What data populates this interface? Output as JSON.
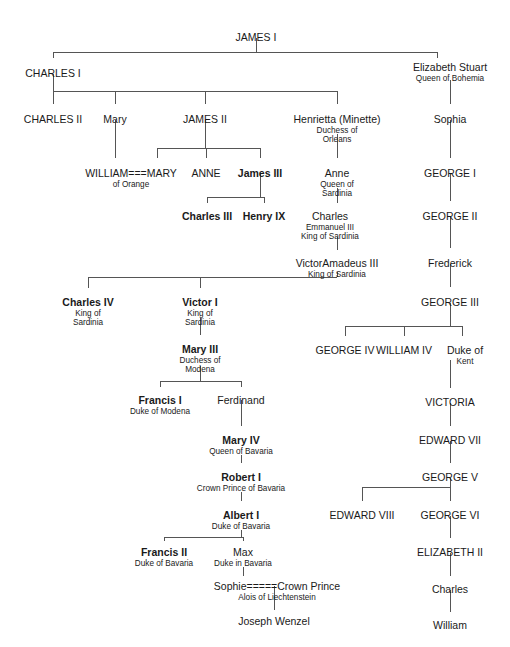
{
  "chart_data": {
    "type": "diagram",
    "subtitle": "",
    "legend": "Bold names indicate Jacobite claimants; '===' indicates marriage",
    "nodes": [
      {
        "id": "james1",
        "name": "JAMES I",
        "titles": [],
        "bold": false,
        "x": 256,
        "y": 32
      },
      {
        "id": "charles1",
        "name": "CHARLES I",
        "titles": [],
        "bold": false,
        "x": 53,
        "y": 68
      },
      {
        "id": "elizstu",
        "name": "Elizabeth Stuart",
        "titles": [
          "Queen of Bohemia"
        ],
        "bold": false,
        "x": 450,
        "y": 62
      },
      {
        "id": "charles2",
        "name": "CHARLES II",
        "titles": [],
        "bold": false,
        "x": 53,
        "y": 114
      },
      {
        "id": "mary",
        "name": "Mary",
        "titles": [],
        "bold": false,
        "x": 115,
        "y": 114
      },
      {
        "id": "james2",
        "name": "JAMES II",
        "titles": [],
        "bold": false,
        "x": 205,
        "y": 114
      },
      {
        "id": "henrietta",
        "name": "Henrietta (Minette)",
        "titles": [
          "Duchess of",
          "Orleans"
        ],
        "bold": false,
        "x": 337,
        "y": 114
      },
      {
        "id": "sophia",
        "name": "Sophia",
        "titles": [],
        "bold": false,
        "x": 450,
        "y": 114
      },
      {
        "id": "williamorange",
        "name": "WILLIAM===MARY",
        "titles": [
          "of Orange"
        ],
        "bold": false,
        "x": 131,
        "y": 168
      },
      {
        "id": "anne",
        "name": "ANNE",
        "titles": [],
        "bold": false,
        "x": 206,
        "y": 168
      },
      {
        "id": "james3",
        "name": "James III",
        "titles": [],
        "bold": true,
        "x": 260,
        "y": 168
      },
      {
        "id": "annesard",
        "name": "Anne",
        "titles": [
          "Queen of",
          "Sardinia"
        ],
        "bold": false,
        "x": 337,
        "y": 168
      },
      {
        "id": "george1",
        "name": "GEORGE I",
        "titles": [],
        "bold": false,
        "x": 450,
        "y": 168
      },
      {
        "id": "charles3",
        "name": "Charles III",
        "titles": [],
        "bold": true,
        "x": 207,
        "y": 211
      },
      {
        "id": "henry9",
        "name": "Henry IX",
        "titles": [],
        "bold": true,
        "x": 264,
        "y": 211
      },
      {
        "id": "charlesem",
        "name": "Charles",
        "titles": [
          "Emmanuel III",
          "King of Sardinia"
        ],
        "bold": false,
        "x": 330,
        "y": 211
      },
      {
        "id": "george2",
        "name": "GEORGE II",
        "titles": [],
        "bold": false,
        "x": 450,
        "y": 211
      },
      {
        "id": "victoram",
        "name": "VictorAmadeus III",
        "titles": [
          "King of Sardinia"
        ],
        "bold": false,
        "x": 337,
        "y": 258
      },
      {
        "id": "frederick",
        "name": "Frederick",
        "titles": [],
        "bold": false,
        "x": 450,
        "y": 258
      },
      {
        "id": "charles4",
        "name": "Charles IV",
        "titles": [
          "King of",
          "Sardinia"
        ],
        "bold": true,
        "x": 88,
        "y": 297
      },
      {
        "id": "victor1",
        "name": "Victor I",
        "titles": [
          "King of",
          "Sardinia"
        ],
        "bold": true,
        "x": 200,
        "y": 297
      },
      {
        "id": "george3",
        "name": "GEORGE III",
        "titles": [],
        "bold": false,
        "x": 450,
        "y": 297
      },
      {
        "id": "george4",
        "name": "GEORGE IV",
        "titles": [],
        "bold": false,
        "x": 345,
        "y": 345
      },
      {
        "id": "william4",
        "name": "WILLIAM IV",
        "titles": [],
        "bold": false,
        "x": 404,
        "y": 345
      },
      {
        "id": "dukekent",
        "name": "Duke of",
        "titles": [
          "Kent"
        ],
        "bold": false,
        "x": 465,
        "y": 345
      },
      {
        "id": "mary3",
        "name": "Mary III",
        "titles": [
          "Duchess of",
          "Modena"
        ],
        "bold": true,
        "x": 200,
        "y": 344
      },
      {
        "id": "francis1",
        "name": "Francis I",
        "titles": [
          "Duke of Modena"
        ],
        "bold": true,
        "x": 160,
        "y": 395
      },
      {
        "id": "ferdinand",
        "name": "Ferdinand",
        "titles": [],
        "bold": false,
        "x": 241,
        "y": 395
      },
      {
        "id": "victoria",
        "name": "VICTORIA",
        "titles": [],
        "bold": false,
        "x": 450,
        "y": 397
      },
      {
        "id": "mary4",
        "name": "Mary IV",
        "titles": [
          "Queen of Bavaria"
        ],
        "bold": true,
        "x": 241,
        "y": 435
      },
      {
        "id": "edward7",
        "name": "EDWARD VII",
        "titles": [],
        "bold": false,
        "x": 450,
        "y": 435
      },
      {
        "id": "robert1",
        "name": "Robert I",
        "titles": [
          "Crown Prince of Bavaria"
        ],
        "bold": true,
        "x": 241,
        "y": 472
      },
      {
        "id": "george5",
        "name": "GEORGE V",
        "titles": [],
        "bold": false,
        "x": 450,
        "y": 472
      },
      {
        "id": "albert1",
        "name": "Albert I",
        "titles": [
          "Duke of Bavaria"
        ],
        "bold": true,
        "x": 241,
        "y": 510
      },
      {
        "id": "edward8",
        "name": "EDWARD VIII",
        "titles": [],
        "bold": false,
        "x": 362,
        "y": 510
      },
      {
        "id": "george6",
        "name": "GEORGE VI",
        "titles": [],
        "bold": false,
        "x": 450,
        "y": 510
      },
      {
        "id": "francis2",
        "name": "Francis II",
        "titles": [
          "Duke of Bavaria"
        ],
        "bold": true,
        "x": 164,
        "y": 547
      },
      {
        "id": "max",
        "name": "Max",
        "titles": [
          "Duke in Bavaria"
        ],
        "bold": false,
        "x": 243,
        "y": 547
      },
      {
        "id": "elizabeth2",
        "name": "ELIZABETH II",
        "titles": [],
        "bold": false,
        "x": 450,
        "y": 547
      },
      {
        "id": "sophiecp",
        "name": "Sophie=====Crown Prince",
        "titles": [
          "Alois of Liechtenstein"
        ],
        "bold": false,
        "x": 277,
        "y": 581
      },
      {
        "id": "charlespw",
        "name": "Charles",
        "titles": [],
        "bold": false,
        "x": 450,
        "y": 584
      },
      {
        "id": "josephw",
        "name": "Joseph Wenzel",
        "titles": [],
        "bold": false,
        "x": 274,
        "y": 616
      },
      {
        "id": "william",
        "name": "William",
        "titles": [],
        "bold": false,
        "x": 450,
        "y": 620
      }
    ],
    "edges": [
      {
        "from": "james1",
        "to": [
          "charles1",
          "elizstu"
        ]
      },
      {
        "from": "charles1",
        "to": [
          "charles2",
          "mary",
          "james2",
          "henrietta"
        ]
      },
      {
        "from": "elizstu",
        "to": [
          "sophia"
        ]
      },
      {
        "from": "sophia",
        "to": [
          "george1"
        ]
      },
      {
        "from": "george1",
        "to": [
          "george2"
        ]
      },
      {
        "from": "george2",
        "to": [
          "frederick"
        ]
      },
      {
        "from": "frederick",
        "to": [
          "george3"
        ]
      },
      {
        "from": "james2",
        "to": [
          "williamorange",
          "anne",
          "james3"
        ]
      },
      {
        "from": "mary",
        "to": [
          "williamorange"
        ]
      },
      {
        "from": "james3",
        "to": [
          "charles3",
          "henry9"
        ]
      },
      {
        "from": "henrietta",
        "to": [
          "annesard"
        ]
      },
      {
        "from": "annesard",
        "to": [
          "charlesem"
        ]
      },
      {
        "from": "charlesem",
        "to": [
          "victoram"
        ]
      },
      {
        "from": "victoram",
        "to": [
          "charles4",
          "victor1"
        ]
      },
      {
        "from": "victor1",
        "to": [
          "mary3"
        ]
      },
      {
        "from": "mary3",
        "to": [
          "francis1",
          "ferdinand"
        ]
      },
      {
        "from": "ferdinand",
        "to": [
          "mary4"
        ]
      },
      {
        "from": "mary4",
        "to": [
          "robert1"
        ]
      },
      {
        "from": "robert1",
        "to": [
          "albert1"
        ]
      },
      {
        "from": "albert1",
        "to": [
          "francis2",
          "max"
        ]
      },
      {
        "from": "max",
        "to": [
          "sophiecp"
        ]
      },
      {
        "from": "sophiecp",
        "to": [
          "josephw"
        ]
      },
      {
        "from": "george3",
        "to": [
          "george4",
          "william4",
          "dukekent"
        ]
      },
      {
        "from": "dukekent",
        "to": [
          "victoria"
        ]
      },
      {
        "from": "victoria",
        "to": [
          "edward7"
        ]
      },
      {
        "from": "edward7",
        "to": [
          "george5"
        ]
      },
      {
        "from": "george5",
        "to": [
          "edward8",
          "george6"
        ]
      },
      {
        "from": "george6",
        "to": [
          "elizabeth2"
        ]
      },
      {
        "from": "elizabeth2",
        "to": [
          "charlespw"
        ]
      },
      {
        "from": "charlespw",
        "to": [
          "william"
        ]
      }
    ]
  },
  "style": {
    "line_color": "#555555",
    "text_color": "#1a1a1a",
    "background": "#ffffff"
  }
}
